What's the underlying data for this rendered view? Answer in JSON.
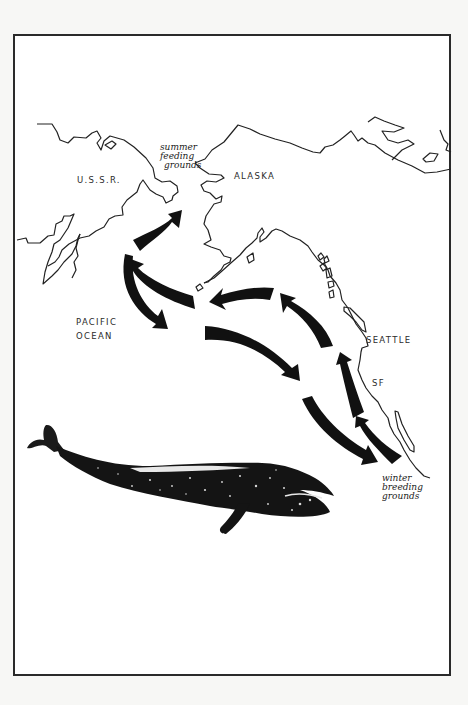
{
  "figure": {
    "type": "migration-map"
  },
  "labels": {
    "ussr": "U.S.S.R.",
    "alaska": "ALASKA",
    "pacific_line1": "PACIFIC",
    "pacific_line2": "OCEAN",
    "seattle": "SEATTLE",
    "sf": "SF",
    "summer": [
      "summer",
      "feeding",
      "grounds"
    ],
    "winter": [
      "winter",
      "breeding",
      "grounds"
    ]
  },
  "colors": {
    "ink": "#111111",
    "coast": "#222222",
    "paper": "#ffffff",
    "background": "#f7f7f5"
  },
  "arrows": {
    "northbound": [
      "winter breeding grounds → SF",
      "SF → Seattle",
      "Seattle → Gulf of Alaska",
      "Gulf of Alaska → Aleutians",
      "Aleutians → Bering Strait",
      "Bering Sea → summer feeding grounds"
    ],
    "southbound": [
      "Bering Sea → Pacific Ocean",
      "Pacific Ocean → open ocean",
      "open ocean → winter breeding grounds"
    ]
  }
}
